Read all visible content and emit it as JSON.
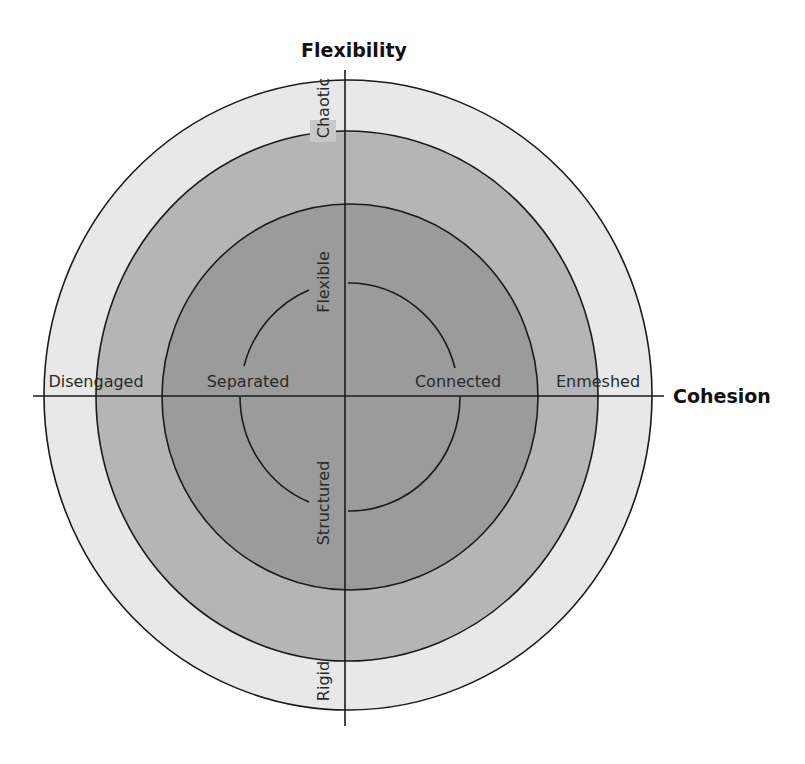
{
  "diagram": {
    "axes": {
      "vertical": {
        "label": "Flexibility"
      },
      "horizontal": {
        "label": "Cohesion"
      }
    },
    "cohesion_levels": {
      "disengaged": "Disengaged",
      "separated": "Separated",
      "connected": "Connected",
      "enmeshed": "Enmeshed"
    },
    "flexibility_levels": {
      "chaotic": "Chaotic",
      "flexible": "Flexible",
      "structured": "Structured",
      "rigid": "Rigid"
    },
    "colors": {
      "outer_ring": "#e8e8e8",
      "middle_ring": "#b5b5b5",
      "core": "#9b9b9b",
      "lines": "#1a1a1a",
      "background": "#ffffff"
    }
  }
}
